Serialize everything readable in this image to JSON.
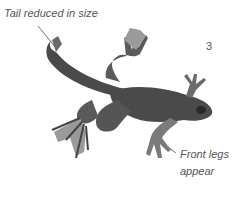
{
  "illustration": {
    "subject": "frog metamorphosis stage",
    "stage_number": "3",
    "labels": {
      "tail": "Tail reduced in size",
      "front_legs_line1": "Front legs",
      "front_legs_line2": "appear"
    },
    "colors": {
      "body": "#4a4a4a",
      "body_light": "#7a7a7a",
      "webbing": "#9a9a9a",
      "label_text": "#555555",
      "leader_line": "#555555"
    }
  }
}
